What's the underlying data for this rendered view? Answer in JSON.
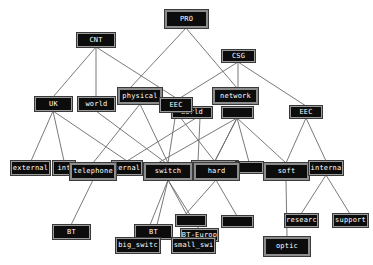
{
  "diagram": {
    "type": "concept-hierarchy-graph",
    "colors": {
      "background": "#ffffff",
      "node_fill": "#0c0c0c",
      "node_text": "#ffffff",
      "node_border": "#9a9a9a",
      "edge": "#6a6a6a"
    },
    "nodes": [
      {
        "id": "pro",
        "label": "PRO",
        "x": 165,
        "y": 10,
        "w": 43,
        "h": 18
      },
      {
        "id": "cnt",
        "label": "CNT",
        "x": 77,
        "y": 33,
        "w": 38,
        "h": 14
      },
      {
        "id": "csg",
        "label": "CSG",
        "x": 222,
        "y": 50,
        "w": 33,
        "h": 12
      },
      {
        "id": "uk",
        "label": "UK",
        "x": 35,
        "y": 97,
        "w": 37,
        "h": 14
      },
      {
        "id": "world_left",
        "label": "world",
        "x": 78,
        "y": 97,
        "w": 37,
        "h": 14
      },
      {
        "id": "physical",
        "label": "physical",
        "x": 118,
        "y": 88,
        "w": 44,
        "h": 16
      },
      {
        "id": "world_mid",
        "label": "world",
        "x": 172,
        "y": 107,
        "w": 40,
        "h": 11
      },
      {
        "id": "eec_mid",
        "label": "EEC",
        "x": 160,
        "y": 98,
        "w": 32,
        "h": 14
      },
      {
        "id": "hidden_net",
        "label": "",
        "x": 222,
        "y": 107,
        "w": 31,
        "h": 11
      },
      {
        "id": "network",
        "label": "network",
        "x": 213,
        "y": 88,
        "w": 45,
        "h": 16
      },
      {
        "id": "eec_right",
        "label": "EEC",
        "x": 290,
        "y": 106,
        "w": 32,
        "h": 12
      },
      {
        "id": "external",
        "label": "external",
        "x": 11,
        "y": 161,
        "w": 39,
        "h": 14
      },
      {
        "id": "int",
        "label": "int",
        "x": 53,
        "y": 161,
        "w": 22,
        "h": 14
      },
      {
        "id": "ternal",
        "label": "ternal",
        "x": 112,
        "y": 161,
        "w": 30,
        "h": 14
      },
      {
        "id": "telephone",
        "label": "telephone",
        "x": 70,
        "y": 163,
        "w": 46,
        "h": 17
      },
      {
        "id": "t_frag",
        "label": "t",
        "x": 192,
        "y": 161,
        "w": 46,
        "h": 14
      },
      {
        "id": "dark_small",
        "label": "",
        "x": 236,
        "y": 162,
        "w": 27,
        "h": 11
      },
      {
        "id": "switch",
        "label": "switch",
        "x": 144,
        "y": 163,
        "w": 48,
        "h": 17
      },
      {
        "id": "hard",
        "label": "hard",
        "x": 194,
        "y": 163,
        "w": 45,
        "h": 17
      },
      {
        "id": "soft",
        "label": "soft",
        "x": 264,
        "y": 163,
        "w": 45,
        "h": 17
      },
      {
        "id": "interna",
        "label": "interna",
        "x": 309,
        "y": 161,
        "w": 34,
        "h": 14
      },
      {
        "id": "bt_left",
        "label": "BT",
        "x": 53,
        "y": 225,
        "w": 37,
        "h": 14
      },
      {
        "id": "bt_mid",
        "label": "BT",
        "x": 135,
        "y": 225,
        "w": 37,
        "h": 14
      },
      {
        "id": "dark_mid",
        "label": "",
        "x": 176,
        "y": 215,
        "w": 30,
        "h": 11
      },
      {
        "id": "bt_europ",
        "label": "BT-Europ",
        "x": 181,
        "y": 229,
        "w": 37,
        "h": 12
      },
      {
        "id": "big_switc",
        "label": "big_switc",
        "x": 116,
        "y": 238,
        "w": 44,
        "h": 15
      },
      {
        "id": "small_swi",
        "label": "small_swi",
        "x": 172,
        "y": 238,
        "w": 43,
        "h": 15
      },
      {
        "id": "dark_right",
        "label": "",
        "x": 222,
        "y": 216,
        "w": 31,
        "h": 11
      },
      {
        "id": "researc",
        "label": "researc",
        "x": 285,
        "y": 214,
        "w": 33,
        "h": 13
      },
      {
        "id": "support",
        "label": "support",
        "x": 333,
        "y": 214,
        "w": 35,
        "h": 13
      },
      {
        "id": "optic",
        "label": "optic",
        "x": 264,
        "y": 237,
        "w": 46,
        "h": 19
      }
    ],
    "edges": [
      [
        186,
        28,
        130,
        88
      ],
      [
        186,
        28,
        237,
        88
      ],
      [
        96,
        47,
        53,
        97
      ],
      [
        96,
        47,
        96,
        97
      ],
      [
        96,
        47,
        176,
        98
      ],
      [
        238,
        62,
        180,
        98
      ],
      [
        238,
        62,
        238,
        88
      ],
      [
        238,
        62,
        306,
        106
      ],
      [
        53,
        111,
        31,
        161
      ],
      [
        53,
        111,
        64,
        161
      ],
      [
        53,
        111,
        127,
        161
      ],
      [
        96,
        111,
        166,
        163
      ],
      [
        140,
        104,
        93,
        163
      ],
      [
        140,
        104,
        168,
        163
      ],
      [
        176,
        112,
        168,
        163
      ],
      [
        176,
        112,
        216,
        163
      ],
      [
        196,
        118,
        127,
        161
      ],
      [
        200,
        118,
        198,
        161
      ],
      [
        237,
        118,
        158,
        163
      ],
      [
        237,
        118,
        214,
        163
      ],
      [
        237,
        118,
        215,
        161
      ],
      [
        237,
        118,
        249,
        162
      ],
      [
        237,
        118,
        286,
        163
      ],
      [
        306,
        118,
        286,
        163
      ],
      [
        306,
        118,
        326,
        161
      ],
      [
        93,
        180,
        71,
        225
      ],
      [
        168,
        180,
        150,
        225
      ],
      [
        168,
        180,
        157,
        225
      ],
      [
        168,
        180,
        187,
        215
      ],
      [
        168,
        180,
        199,
        229
      ],
      [
        216,
        180,
        185,
        215
      ],
      [
        216,
        180,
        237,
        216
      ],
      [
        286,
        180,
        287,
        237
      ],
      [
        326,
        175,
        301,
        214
      ],
      [
        326,
        175,
        350,
        214
      ]
    ]
  }
}
